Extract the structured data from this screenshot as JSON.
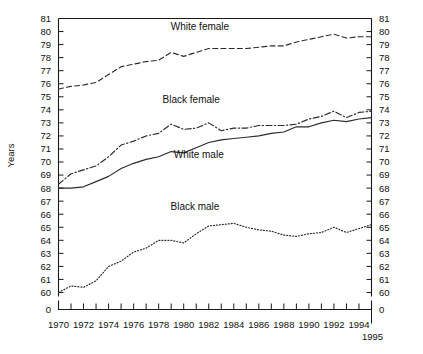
{
  "chart_data": {
    "type": "line",
    "title": "",
    "xlabel": "",
    "ylabel": "Years",
    "xlim": [
      1970,
      1995
    ],
    "ylim": [
      60,
      81
    ],
    "grid": false,
    "legend_position": "inline-labels",
    "axis_break_label": "0",
    "x": [
      1970,
      1971,
      1972,
      1973,
      1974,
      1975,
      1976,
      1977,
      1978,
      1979,
      1980,
      1981,
      1982,
      1983,
      1984,
      1985,
      1986,
      1987,
      1988,
      1989,
      1990,
      1991,
      1992,
      1993,
      1994,
      1995
    ],
    "xtick_labels": [
      "1970",
      "1972",
      "1974",
      "1976",
      "1978",
      "1980",
      "1982",
      "1984",
      "1986",
      "1988",
      "1990",
      "1992",
      "1994",
      "1995"
    ],
    "ytick_labels": [
      "81",
      "80",
      "79",
      "78",
      "77",
      "76",
      "75",
      "74",
      "73",
      "72",
      "71",
      "70",
      "69",
      "68",
      "67",
      "66",
      "65",
      "64",
      "63",
      "62",
      "61",
      "60",
      "0"
    ],
    "series": [
      {
        "name": "White female",
        "style": "dashed",
        "label": "White female",
        "values": [
          75.6,
          75.8,
          75.9,
          76.1,
          76.7,
          77.3,
          77.5,
          77.7,
          77.8,
          78.4,
          78.1,
          78.4,
          78.7,
          78.7,
          78.7,
          78.7,
          78.8,
          78.9,
          78.9,
          79.2,
          79.4,
          79.6,
          79.8,
          79.5,
          79.6,
          79.6
        ]
      },
      {
        "name": "Black female",
        "style": "dash-dot",
        "label": "Black female",
        "values": [
          68.3,
          69.1,
          69.4,
          69.7,
          70.4,
          71.3,
          71.6,
          72.0,
          72.2,
          72.9,
          72.5,
          72.6,
          73.0,
          72.4,
          72.6,
          72.6,
          72.8,
          72.8,
          72.8,
          72.9,
          73.3,
          73.5,
          73.9,
          73.4,
          73.8,
          73.9
        ]
      },
      {
        "name": "White male",
        "style": "solid",
        "label": "White male",
        "values": [
          68.0,
          68.0,
          68.1,
          68.5,
          68.9,
          69.5,
          69.9,
          70.2,
          70.4,
          70.8,
          70.7,
          71.1,
          71.5,
          71.7,
          71.8,
          71.9,
          72.0,
          72.2,
          72.3,
          72.7,
          72.7,
          73.0,
          73.2,
          73.1,
          73.3,
          73.4
        ]
      },
      {
        "name": "Black male",
        "style": "dotted",
        "label": "Black male",
        "values": [
          60.0,
          60.5,
          60.4,
          60.9,
          62.0,
          62.4,
          63.1,
          63.4,
          64.0,
          64.0,
          63.8,
          64.5,
          65.1,
          65.2,
          65.3,
          65.0,
          64.8,
          64.7,
          64.4,
          64.3,
          64.5,
          64.6,
          65.0,
          64.6,
          64.9,
          65.2
        ]
      }
    ],
    "annotations": [
      {
        "text": "White female",
        "x": 1981.3,
        "y": 80.1
      },
      {
        "text": "Black female",
        "x": 1980.6,
        "y": 74.5
      },
      {
        "text": "White male",
        "x": 1981.2,
        "y": 70.3
      },
      {
        "text": "Black male",
        "x": 1980.9,
        "y": 66.3
      }
    ]
  }
}
